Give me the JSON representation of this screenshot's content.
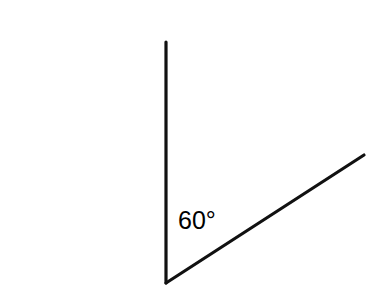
{
  "figure": {
    "background_color": "#ffffff",
    "stroke_color": "#111111",
    "stroke_width": 3.2,
    "canvas": {
      "width": 377,
      "height": 302
    },
    "vertex": {
      "x": 166,
      "y": 283
    },
    "rays": [
      {
        "name": "vertical-ray",
        "from": {
          "x": 166,
          "y": 283
        },
        "to": {
          "x": 166,
          "y": 42
        },
        "direction": "up"
      },
      {
        "name": "slanted-ray",
        "from": {
          "x": 166,
          "y": 283
        },
        "to": {
          "x": 364,
          "y": 155
        },
        "direction": "up-right"
      }
    ],
    "angle_label": {
      "text": "60°",
      "value": 60,
      "unit": "degrees",
      "x": 178,
      "y": 229,
      "color": "#000000"
    }
  }
}
